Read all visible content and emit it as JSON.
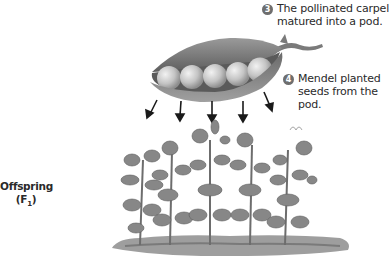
{
  "steps": [
    {
      "number": "3",
      "lines": [
        "The pollinated carpel",
        "matured into a pod."
      ]
    },
    {
      "number": "4",
      "lines": [
        "Mendel planted",
        "seeds from the",
        "pod."
      ]
    }
  ],
  "side_label": {
    "line1": "Offspring",
    "line2_main": "(F",
    "line2_sub": "1",
    "line2_end": ")"
  },
  "illustration": {
    "pod": "pea-pod-with-five-peas",
    "arrow_count": 5,
    "plants": "row-of-five-pea-plants",
    "colors": {
      "pod": "#7d7d7d",
      "peas": "#c8c8c8",
      "plant": "#8a8a8a",
      "soil": "#9a9a9a",
      "badge": "#6e6e6e"
    }
  }
}
